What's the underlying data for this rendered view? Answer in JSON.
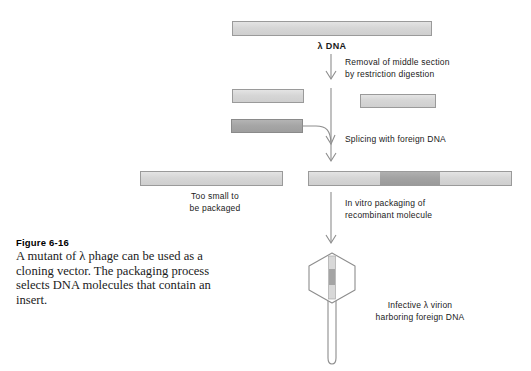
{
  "figure": {
    "number": "Figure 6-16",
    "caption": "A mutant of λ phage can be used as a cloning vector. The packaging process selects DNA molecules that contain an insert."
  },
  "diagram": {
    "lambda_dna_label": "λ DNA",
    "step_restriction": "Removal of middle section\nby restriction digestion",
    "step_splicing": "Splicing with foreign DNA",
    "step_packaging": "In vitro packaging of\nrecombinant molecule",
    "too_small_label": "Too small to\nbe packaged",
    "virion_label": "Infective λ virion\nharboring foreign DNA"
  },
  "colors": {
    "lambda_dna_fill": "#d6d6d6",
    "foreign_dna_fill": "#a6a6a6",
    "insert_fill": "#a2a2a2",
    "outline": "#8d8d8d",
    "text": "#1a1a1a"
  },
  "elements": {
    "lambda_dna_bar": "full-length lambda DNA",
    "left_arm": "left arm fragment",
    "right_arm": "right arm fragment",
    "foreign_dna_bar": "foreign DNA fragment",
    "religated_arms_bar": "religated arms without insert",
    "recombinant_bar": "recombinant DNA with insert",
    "phage_particle": "lambda virion"
  }
}
